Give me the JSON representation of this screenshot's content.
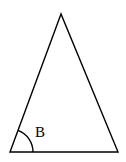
{
  "diagram": {
    "type": "triangle",
    "vertices": {
      "apex": [
        61,
        14
      ],
      "bottom_left": [
        10,
        152
      ],
      "bottom_right": [
        118,
        152
      ]
    },
    "angle_marks": [
      {
        "vertex": "bottom_left",
        "label": "B",
        "radius": 23
      }
    ],
    "stroke_color": "#000000",
    "background": "#ffffff"
  }
}
